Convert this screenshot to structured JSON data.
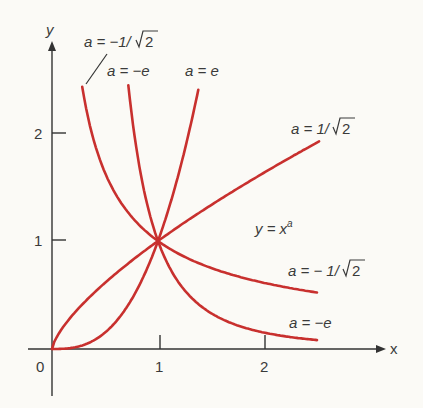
{
  "chart_data": {
    "type": "line",
    "xlabel": "x",
    "ylabel": "y",
    "xlim": [
      0,
      2.5
    ],
    "ylim": [
      0,
      2.45
    ],
    "x_ticks": [
      "0",
      "1",
      "2"
    ],
    "y_ticks": [
      "1",
      "2"
    ],
    "grid": false,
    "annotation": "y = x",
    "annotation_sup": "a",
    "series": [
      {
        "name": "a = e",
        "exponent": 2.718,
        "x": [
          0,
          0.5,
          1,
          1.2,
          1.38
        ],
        "values": [
          0,
          0.152,
          1,
          1.64,
          2.4
        ]
      },
      {
        "name": "a = 1/√2",
        "exponent": 0.707,
        "x": [
          0,
          0.5,
          1,
          1.5,
          2,
          2.52
        ],
        "values": [
          0,
          0.612,
          1,
          1.332,
          1.632,
          1.92
        ]
      },
      {
        "name": "a = -1/√2",
        "exponent": -0.707,
        "x": [
          0.285,
          0.5,
          1,
          1.5,
          2,
          2.5
        ],
        "values": [
          2.43,
          1.632,
          1,
          0.751,
          0.613,
          0.523
        ]
      },
      {
        "name": "a = -e",
        "exponent": -2.718,
        "x": [
          0.72,
          0.85,
          1,
          1.5,
          2,
          2.5
        ],
        "values": [
          2.44,
          1.555,
          1,
          0.332,
          0.152,
          0.083
        ]
      }
    ],
    "labels": {
      "a_neg_inv_sqrt2_top": {
        "prefix": "a = −1/",
        "radical": "2"
      },
      "a_neg_e_top": {
        "text": "a = −e"
      },
      "a_e_top": {
        "text": "a = e"
      },
      "a_inv_sqrt2_right": {
        "prefix": "a = 1/",
        "radical": "2"
      },
      "a_neg_inv_sqrt2_right": {
        "prefix": "a = − 1/",
        "radical": "2"
      },
      "a_neg_e_right": {
        "text": "a = −e"
      }
    },
    "colors": {
      "curve": "#c8302e",
      "axis": "#333333",
      "background": "#fbfaf6"
    }
  }
}
